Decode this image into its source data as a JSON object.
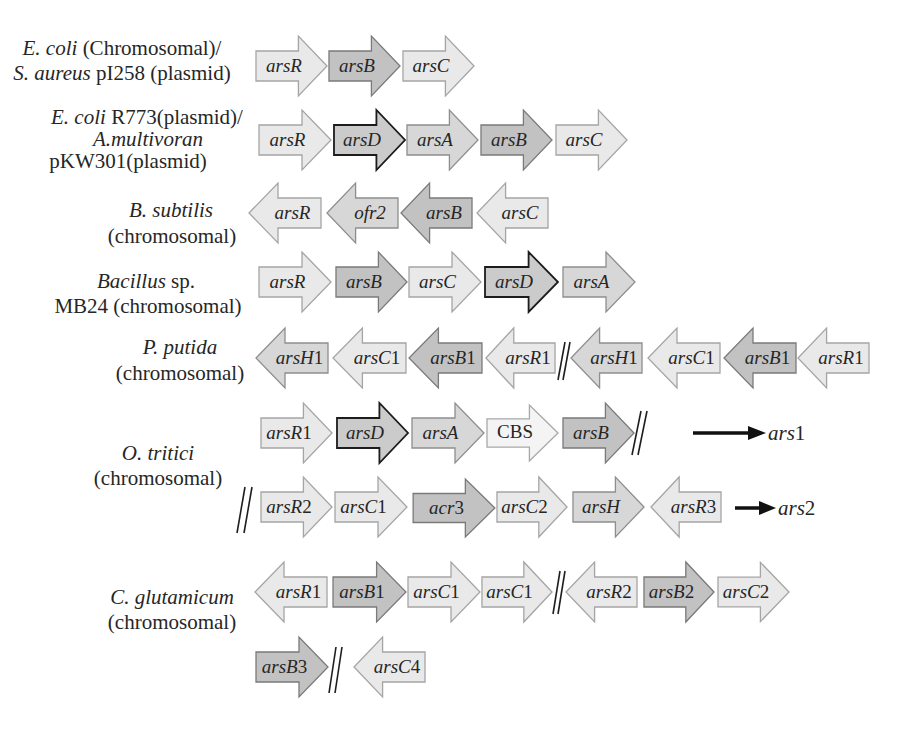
{
  "operons": [
    {
      "label": [
        {
          "italic": "E. coli",
          "roman": " (Chromosomal)/"
        },
        {
          "italic": "S. aureus",
          "roman": " pI258 (plasmid)"
        }
      ],
      "rows": [
        {
          "genes": [
            {
              "italic": "arsR",
              "roman": "",
              "direction": "right",
              "shade": "light"
            },
            {
              "italic": "arsB",
              "roman": "",
              "direction": "right",
              "shade": "dark"
            },
            {
              "italic": "arsC",
              "roman": "",
              "direction": "right",
              "shade": "light"
            }
          ]
        }
      ]
    },
    {
      "label": [
        {
          "italic": "E. coli",
          "roman": " R773(plasmid)/"
        },
        {
          "italic": "A.multivoran",
          "roman": ""
        },
        {
          "italic": "",
          "roman": "pKW301(plasmid)"
        }
      ],
      "rows": [
        {
          "genes": [
            {
              "italic": "arsR",
              "roman": "",
              "direction": "right",
              "shade": "light"
            },
            {
              "italic": "arsD",
              "roman": "",
              "direction": "right",
              "shade": "outlined"
            },
            {
              "italic": "arsA",
              "roman": "",
              "direction": "right",
              "shade": "medium"
            },
            {
              "italic": "arsB",
              "roman": "",
              "direction": "right",
              "shade": "dark"
            },
            {
              "italic": "arsC",
              "roman": "",
              "direction": "right",
              "shade": "light"
            }
          ]
        }
      ]
    },
    {
      "label": [
        {
          "italic": "B. subtilis",
          "roman": ""
        },
        {
          "italic": "",
          "roman": "(chromosomal)"
        }
      ],
      "rows": [
        {
          "genes": [
            {
              "italic": "arsR",
              "roman": "",
              "direction": "left",
              "shade": "light"
            },
            {
              "italic": "ofr2",
              "roman": "",
              "direction": "left",
              "shade": "medium"
            },
            {
              "italic": "arsB",
              "roman": "",
              "direction": "left",
              "shade": "dark"
            },
            {
              "italic": "arsC",
              "roman": "",
              "direction": "left",
              "shade": "light"
            }
          ]
        }
      ]
    },
    {
      "label": [
        {
          "italic": "Bacillus",
          "roman": " sp."
        },
        {
          "italic": "",
          "roman": "MB24 (chromosomal)"
        }
      ],
      "rows": [
        {
          "genes": [
            {
              "italic": "arsR",
              "roman": "",
              "direction": "right",
              "shade": "light"
            },
            {
              "italic": "arsB",
              "roman": "",
              "direction": "right",
              "shade": "dark"
            },
            {
              "italic": "arsC",
              "roman": "",
              "direction": "right",
              "shade": "light"
            },
            {
              "italic": "arsD",
              "roman": "",
              "direction": "right",
              "shade": "outlined"
            },
            {
              "italic": "arsA",
              "roman": "",
              "direction": "right",
              "shade": "medium"
            }
          ]
        }
      ]
    },
    {
      "label": [
        {
          "italic": "P. putida",
          "roman": ""
        },
        {
          "italic": "",
          "roman": "(chromosomal)"
        }
      ],
      "rows": [
        {
          "breaks_after": [
            3
          ],
          "genes": [
            {
              "italic": "arsH",
              "roman": "1",
              "direction": "left",
              "shade": "medium"
            },
            {
              "italic": "arsC",
              "roman": "1",
              "direction": "left",
              "shade": "light"
            },
            {
              "italic": "arsB",
              "roman": "1",
              "direction": "left",
              "shade": "dark"
            },
            {
              "italic": "arsR",
              "roman": "1",
              "direction": "left",
              "shade": "light"
            },
            {
              "italic": "arsH",
              "roman": "1",
              "direction": "left",
              "shade": "medium"
            },
            {
              "italic": "arsC",
              "roman": "1",
              "direction": "left",
              "shade": "light"
            },
            {
              "italic": "arsB",
              "roman": "1",
              "direction": "left",
              "shade": "dark"
            },
            {
              "italic": "arsR",
              "roman": "1",
              "direction": "left",
              "shade": "light"
            }
          ]
        }
      ]
    },
    {
      "label": [
        {
          "italic": "O. tritici",
          "roman": ""
        },
        {
          "italic": "",
          "roman": "(chromosomal)"
        }
      ],
      "rows": [
        {
          "cluster": {
            "italic": "ars",
            "roman": "1"
          },
          "breaks_after": [
            4
          ],
          "genes": [
            {
              "italic": "arsR",
              "roman": "1",
              "direction": "right",
              "shade": "light"
            },
            {
              "italic": "arsD",
              "roman": "",
              "direction": "right",
              "shade": "outlined"
            },
            {
              "italic": "arsA",
              "roman": "",
              "direction": "right",
              "shade": "medium"
            },
            {
              "italic": "",
              "roman": "CBS",
              "direction": "right",
              "shade": "vlight"
            },
            {
              "italic": "arsB",
              "roman": "",
              "direction": "right",
              "shade": "dark"
            }
          ]
        },
        {
          "cluster": {
            "italic": "ars",
            "roman": "2"
          },
          "break_before": true,
          "genes": [
            {
              "italic": "arsR",
              "roman": "2",
              "direction": "right",
              "shade": "light"
            },
            {
              "italic": "arsC",
              "roman": "1",
              "direction": "right",
              "shade": "light"
            },
            {
              "italic": "acr",
              "roman": "3",
              "direction": "right",
              "shade": "dark"
            },
            {
              "italic": "arsC",
              "roman": "2",
              "direction": "right",
              "shade": "light"
            },
            {
              "italic": "arsH",
              "roman": "",
              "direction": "right",
              "shade": "medium"
            },
            {
              "italic": "arsR",
              "roman": "3",
              "direction": "left",
              "shade": "light"
            }
          ]
        }
      ]
    },
    {
      "label": [
        {
          "italic": "C. glutamicum",
          "roman": ""
        },
        {
          "italic": "",
          "roman": "(chromosomal)"
        }
      ],
      "rows": [
        {
          "breaks_after": [
            3
          ],
          "genes": [
            {
              "italic": "arsR",
              "roman": "1",
              "direction": "left",
              "shade": "light"
            },
            {
              "italic": "arsB",
              "roman": "1",
              "direction": "right",
              "shade": "dark"
            },
            {
              "italic": "arsC",
              "roman": "1",
              "direction": "right",
              "shade": "light"
            },
            {
              "italic": "arsC",
              "roman": "1",
              "direction": "right",
              "shade": "light"
            },
            {
              "italic": "arsR",
              "roman": "2",
              "direction": "left",
              "shade": "light"
            },
            {
              "italic": "arsB",
              "roman": "2",
              "direction": "right",
              "shade": "dark"
            },
            {
              "italic": "arsC",
              "roman": "2",
              "direction": "right",
              "shade": "light"
            }
          ]
        },
        {
          "breaks_after": [
            0
          ],
          "genes": [
            {
              "italic": "arsB",
              "roman": "3",
              "direction": "right",
              "shade": "dark"
            },
            {
              "italic": "arsC",
              "roman": "4",
              "direction": "left",
              "shade": "light"
            }
          ]
        }
      ]
    }
  ],
  "colors": {
    "light": "#e9e9e9",
    "very_light": "#f4f4f4",
    "medium": "#d7d7d7",
    "dark": "#c2c2c2",
    "outline_dark": "#1c1c1c",
    "text": "#262626"
  }
}
